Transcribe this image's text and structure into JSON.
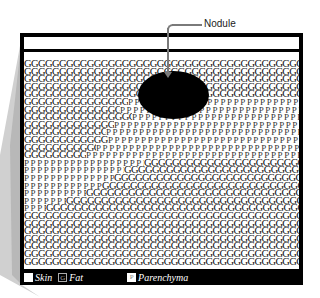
{
  "diagram": {
    "callout_label": "Nodule",
    "tokens": {
      "fat": "G",
      "parenchyma": "P"
    },
    "legend": [
      {
        "key": "skin",
        "swatch": "",
        "label": "Skin"
      },
      {
        "key": "fat",
        "swatch": "G",
        "label": "Fat"
      },
      {
        "key": "parenchyma",
        "swatch": "P",
        "label": "Parenchyma"
      }
    ],
    "colors": {
      "frame": "#000000",
      "skin": "#ffffff",
      "nodule": "#000000",
      "callout": "#7a7a7a",
      "shadow": "#c8c8c8"
    },
    "rows": [
      [
        275,
        0,
        0
      ],
      [
        275,
        0,
        0
      ],
      [
        275,
        0,
        0
      ],
      [
        275,
        0,
        0
      ],
      [
        275,
        0,
        0
      ],
      [
        104,
        171,
        0
      ],
      [
        96,
        179,
        0
      ],
      [
        108,
        167,
        0
      ],
      [
        90,
        185,
        0
      ],
      [
        82,
        193,
        0
      ],
      [
        84,
        191,
        0
      ],
      [
        72,
        203,
        0
      ],
      [
        62,
        213,
        0
      ],
      [
        0,
        120,
        155
      ],
      [
        0,
        100,
        175
      ],
      [
        0,
        90,
        185
      ],
      [
        0,
        78,
        197
      ],
      [
        0,
        62,
        213
      ],
      [
        0,
        42,
        233
      ],
      [
        0,
        22,
        253
      ],
      [
        275,
        0,
        0
      ],
      [
        275,
        0,
        0
      ],
      [
        275,
        0,
        0
      ],
      [
        275,
        0,
        0
      ],
      [
        275,
        0,
        0
      ],
      [
        275,
        0,
        0
      ],
      [
        275,
        0,
        0
      ]
    ]
  }
}
